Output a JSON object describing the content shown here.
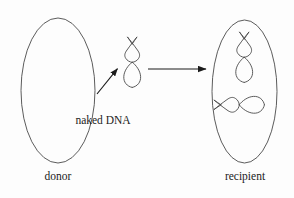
{
  "diagram": {
    "background_color": "#fdfdfd",
    "stroke_color": "#3a3a3a",
    "arrow_color": "#1b1b1b",
    "text_color": "#1b1b1b"
  },
  "labels": {
    "naked_dna": "naked DNA",
    "donor": "donor",
    "recipient": "recipient"
  },
  "cells": {
    "donor": {
      "name": "donor",
      "shape": "ellipse",
      "cx": 58,
      "cy": 90.5,
      "rx": 37,
      "ry": 72.5,
      "contents": []
    },
    "recipient": {
      "name": "recipient",
      "shape": "ellipse",
      "cx": 244.5,
      "cy": 91.5,
      "rx": 32.5,
      "ry": 71.5,
      "contents": [
        "chromosomal-dna",
        "transformed-dna"
      ]
    }
  },
  "dna": {
    "naked": {
      "name": "naked DNA",
      "form": "supercoiled plasmid",
      "orientation": "vertical",
      "cx": 132,
      "cy": 62,
      "scale": 1.0
    },
    "recipient_upper": {
      "name": "chromosomal DNA",
      "form": "supercoiled plasmid",
      "orientation": "vertical",
      "cx": 244,
      "cy": 57,
      "scale": 1.0
    },
    "recipient_lower": {
      "name": "transformed DNA",
      "form": "supercoiled plasmid",
      "orientation": "horizontal",
      "cx": 239,
      "cy": 105,
      "scale": 1.0
    }
  },
  "arrows": {
    "release": {
      "name": "DNA release arrow",
      "direction": "up-right",
      "x1": 97,
      "y1": 94,
      "x2": 119,
      "y2": 67
    },
    "uptake": {
      "name": "DNA uptake arrow",
      "direction": "right",
      "x1": 148,
      "y1": 69,
      "x2": 207,
      "y2": 69
    }
  }
}
